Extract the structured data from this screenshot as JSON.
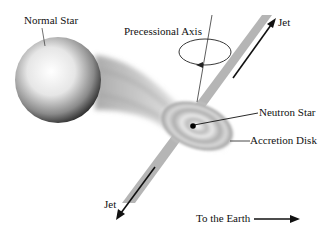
{
  "diagram": {
    "title": "",
    "labels": {
      "normal_star": "Normal Star",
      "precessional_axis": "Precessional Axis",
      "jet_top": "Jet",
      "neutron_star": "Neutron Star",
      "accretion_disk": "Accretion Disk",
      "jet_bottom": "Jet",
      "to_earth": "To the Earth"
    },
    "colors": {
      "jet": "#b5b5b5",
      "arrow": "#111111",
      "background": "#ffffff"
    }
  }
}
